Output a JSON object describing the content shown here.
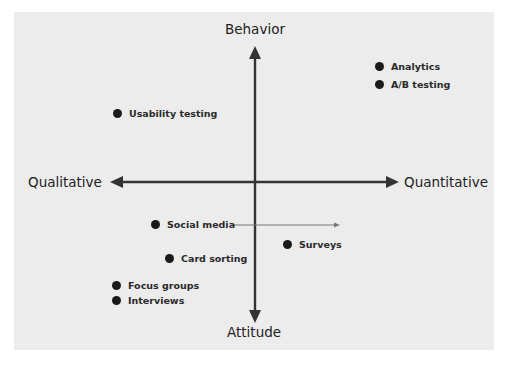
{
  "diagram": {
    "type": "quadrant",
    "axes": {
      "top": "Behavior",
      "bottom": "Attitude",
      "left": "Qualitative",
      "right": "Quantitative"
    },
    "items": [
      {
        "label": "Analytics",
        "quadrant": "behavior-quantitative"
      },
      {
        "label": "A/B testing",
        "quadrant": "behavior-quantitative"
      },
      {
        "label": "Usability testing",
        "quadrant": "behavior-qualitative"
      },
      {
        "label": "Social media",
        "quadrant": "attitude-qualitative",
        "arrow_to": "quantitative"
      },
      {
        "label": "Surveys",
        "quadrant": "attitude-quantitative"
      },
      {
        "label": "Card sorting",
        "quadrant": "attitude-qualitative"
      },
      {
        "label": "Focus groups",
        "quadrant": "attitude-qualitative"
      },
      {
        "label": "Interviews",
        "quadrant": "attitude-qualitative"
      }
    ],
    "colors": {
      "background": "#ececec",
      "axis": "#333333",
      "dot": "#1a1a1a",
      "thin_arrow": "#777777"
    }
  }
}
